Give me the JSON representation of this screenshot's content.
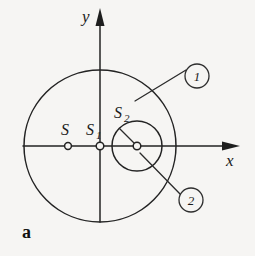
{
  "figure": {
    "letter": "a",
    "background_color": "#f6f5f3",
    "line_color": "#232323"
  },
  "axes": {
    "x_label": "x",
    "y_label": "y",
    "origin_label": "S1"
  },
  "points": [
    {
      "id": "S",
      "label": "S",
      "subscript": "",
      "x": 68,
      "y": 146,
      "marker": "open-circle"
    },
    {
      "id": "S1",
      "label": "S",
      "subscript": "1",
      "x": 100,
      "y": 146,
      "marker": "open-circle"
    },
    {
      "id": "S2",
      "label": "S",
      "subscript": "2",
      "x": 137,
      "y": 146,
      "marker": "open-circle"
    }
  ],
  "circles": [
    {
      "id": "outer-circle",
      "cx": 100,
      "cy": 146,
      "r": 76,
      "callout": "1"
    },
    {
      "id": "inner-circle",
      "cx": 137,
      "cy": 146,
      "r": 25,
      "callout": "2"
    }
  ],
  "callouts": [
    {
      "id": "callout-1",
      "label": "1",
      "cx": 197,
      "cy": 76,
      "r": 12
    },
    {
      "id": "callout-2",
      "label": "2",
      "cx": 191,
      "cy": 200,
      "r": 12
    }
  ]
}
